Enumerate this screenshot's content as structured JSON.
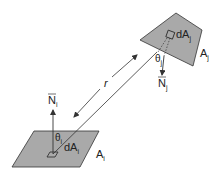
{
  "diagram": {
    "colors": {
      "patch_fill": "#a9a9a9",
      "stroke": "#333333",
      "background": "#ffffff"
    },
    "patch_j": {
      "area_label": "A",
      "area_sub": "j",
      "element_label": "dA",
      "element_sub": "j",
      "angle_label": "θ",
      "angle_sub": "j",
      "normal_label": "N",
      "normal_sub": "j"
    },
    "patch_i": {
      "area_label": "A",
      "area_sub": "i",
      "element_label": "dA",
      "element_sub": "i",
      "angle_label": "θ",
      "angle_sub": "i",
      "normal_label": "N",
      "normal_sub": "i"
    },
    "distance_label": "r"
  }
}
